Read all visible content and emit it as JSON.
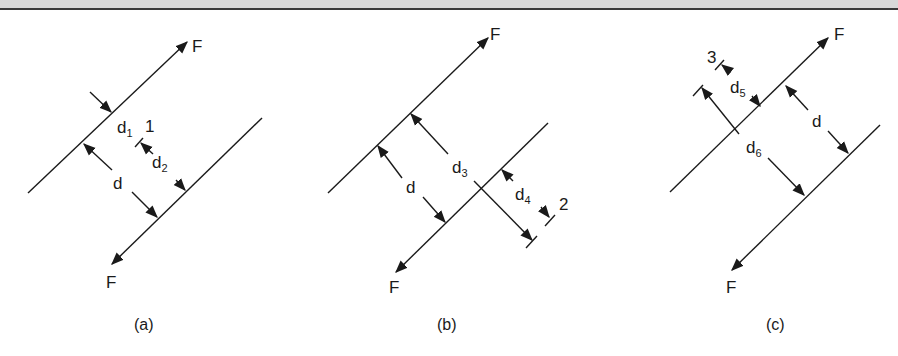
{
  "figure": {
    "panels": [
      {
        "caption": "(a)",
        "force_top": "F",
        "force_bottom": "F",
        "labels": {
          "d": "d",
          "d1": "d",
          "d1_sub": "1",
          "d2": "d",
          "d2_sub": "2",
          "ref": "1"
        }
      },
      {
        "caption": "(b)",
        "force_top": "F",
        "force_bottom": "F",
        "labels": {
          "d": "d",
          "d3": "d",
          "d3_sub": "3",
          "d4": "d",
          "d4_sub": "4",
          "ref": "2"
        }
      },
      {
        "caption": "(c)",
        "force_top": "F",
        "force_bottom": "F",
        "labels": {
          "d": "d",
          "d5": "d",
          "d5_sub": "5",
          "d6": "d",
          "d6_sub": "6",
          "ref": "3"
        }
      }
    ]
  }
}
